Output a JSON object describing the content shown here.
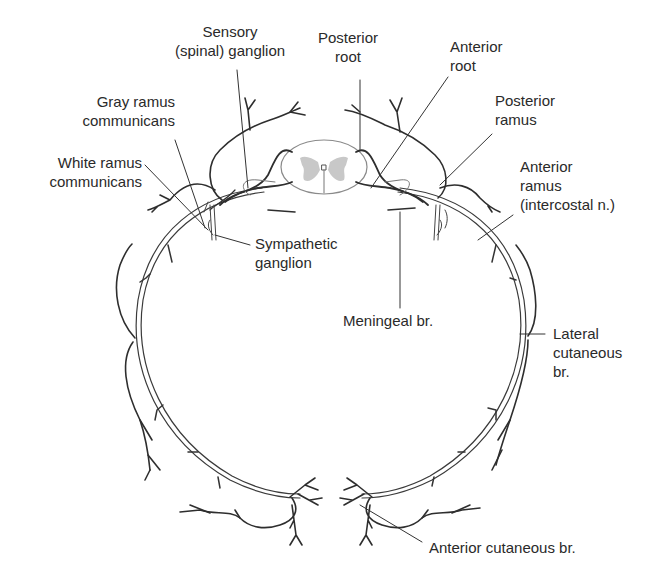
{
  "figure": {
    "colors": {
      "nerve_stroke": "#2e2e2e",
      "spinal_cord_outline": "#8a8a8a",
      "gray_matter": "#c8c8c8",
      "leader_line": "#333333",
      "background": "#ffffff",
      "text": "#2a2a2a"
    }
  },
  "labels": {
    "sensory_ganglion": {
      "line1": "Sensory",
      "line2": "(spinal) ganglion"
    },
    "posterior_root": {
      "line1": "Posterior",
      "line2": "root"
    },
    "anterior_root": {
      "line1": "Anterior",
      "line2": "root"
    },
    "gray_ramus": {
      "line1": "Gray ramus",
      "line2": "communicans"
    },
    "posterior_ramus": {
      "line1": "Posterior",
      "line2": "ramus"
    },
    "white_ramus": {
      "line1": "White ramus",
      "line2": "communicans"
    },
    "anterior_ramus": {
      "line1": "Anterior",
      "line2": "ramus",
      "line3": "(intercostal n.)"
    },
    "sympathetic_ganglion": {
      "line1": "Sympathetic",
      "line2": "ganglion"
    },
    "meningeal_branch": {
      "line1": "Meningeal br."
    },
    "lateral_cutaneous": {
      "line1": "Lateral",
      "line2": "cutaneous",
      "line3": "br."
    },
    "anterior_cutaneous": {
      "line1": "Anterior cutaneous br."
    }
  }
}
